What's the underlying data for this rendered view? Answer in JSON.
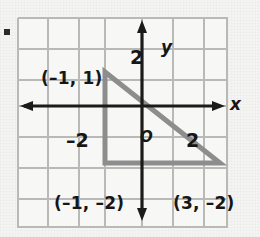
{
  "figure": {
    "kind": "coordinate-plane-triangle",
    "bullet": "",
    "axes": {
      "x_label": "x",
      "y_label": "y",
      "origin_label": "O",
      "x_ticks": [
        {
          "value": -2,
          "label": "–2"
        },
        {
          "value": 2,
          "label": "2"
        }
      ],
      "y_ticks": [
        {
          "value": 2,
          "label": "2"
        }
      ],
      "x_range": [
        -3.5,
        3.5
      ],
      "y_range": [
        -3.5,
        3.5
      ]
    },
    "vertices": [
      {
        "id": "A",
        "x": -1,
        "y": 1,
        "label": "(–1, 1)"
      },
      {
        "id": "B",
        "x": -1,
        "y": -2,
        "label": "(–1, –2)"
      },
      {
        "id": "C",
        "x": 3,
        "y": -2,
        "label": "(3, –2)"
      }
    ],
    "colors": {
      "grid_line": "#b9b9b7",
      "axis_line": "#1b1b1b",
      "shape_stroke": "#8d8d8d",
      "label_text": "#161616",
      "panel_background": "#f7f7f6",
      "page_background": "#f4f4f3"
    }
  }
}
